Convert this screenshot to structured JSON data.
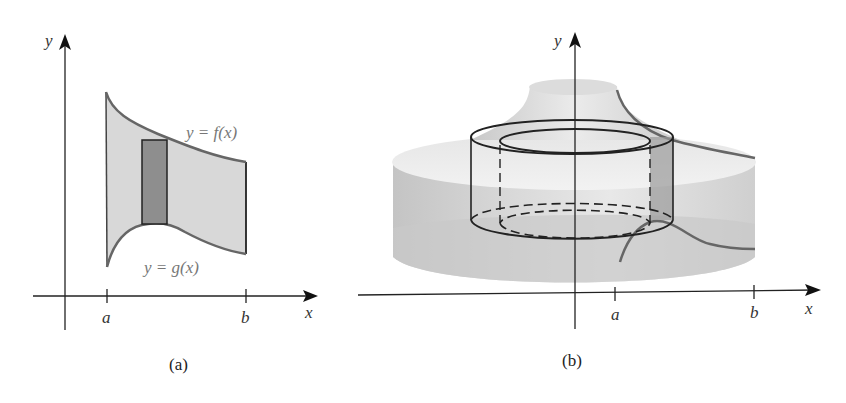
{
  "figure": {
    "panel_a": {
      "caption": "(a)",
      "axis_x_label": "x",
      "axis_y_label": "y",
      "tick_a": "a",
      "tick_b": "b",
      "upper_curve_label": "y = f(x)",
      "lower_curve_label": "y = g(x)",
      "region_fill": "#d8d8d8",
      "strip_fill": "#8e8e8e",
      "curve_color": "#666666"
    },
    "panel_b": {
      "caption": "(b)",
      "axis_x_label": "x",
      "axis_y_label": "y",
      "tick_a": "a",
      "tick_b": "b",
      "solid_fill": "#d0d0d0",
      "shell_stroke": "#222222"
    }
  }
}
